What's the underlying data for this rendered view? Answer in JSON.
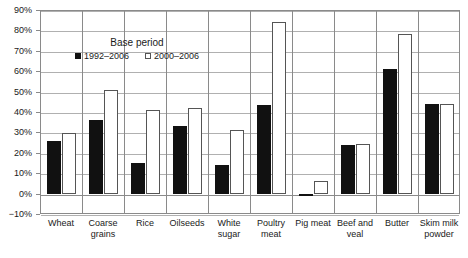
{
  "chart_data": {
    "type": "bar",
    "title": "",
    "xlabel": "",
    "ylabel": "",
    "ylim": [
      -10,
      90
    ],
    "ytick_step": 10,
    "ytick_labels": [
      "90%",
      "80%",
      "70%",
      "60%",
      "50%",
      "40%",
      "30%",
      "20%",
      "10%",
      "0%",
      "-10%"
    ],
    "ytick_values": [
      90,
      80,
      70,
      60,
      50,
      40,
      30,
      20,
      10,
      0,
      -10
    ],
    "grid": true,
    "legend_position": "inside-top-left",
    "legend_title": "Base period",
    "categories": [
      "Wheat",
      "Coarse grains",
      "Rice",
      "Oilseeds",
      "White sugar",
      "Poultry meat",
      "Pig meat",
      "Beef and veal",
      "Butter",
      "Skim milk powder"
    ],
    "series": [
      {
        "name": "1992-2006",
        "color": "#111111",
        "fill": "solid",
        "values": [
          26,
          36,
          15,
          33,
          14,
          43.5,
          -1,
          24,
          61,
          44
        ]
      },
      {
        "name": "2000-2006",
        "color": "#ffffff",
        "fill": "open",
        "values": [
          29.5,
          51,
          41,
          42,
          31,
          84,
          6,
          24.5,
          78,
          44
        ]
      }
    ]
  },
  "legend": {
    "title": "Base period",
    "entries": [
      {
        "label": "1992–2006",
        "swatch": "filled-square"
      },
      {
        "label": "2000–2006",
        "swatch": "open-square"
      }
    ]
  },
  "axes": {
    "y_labels": [
      "90%",
      "80%",
      "70%",
      "60%",
      "50%",
      "40%",
      "30%",
      "20%",
      "10%",
      "0%",
      "−10%"
    ],
    "x_labels": [
      [
        "Wheat"
      ],
      [
        "Coarse",
        "grains"
      ],
      [
        "Rice"
      ],
      [
        "Oilseeds"
      ],
      [
        "White",
        "sugar"
      ],
      [
        "Poultry",
        "meat"
      ],
      [
        "Pig meat"
      ],
      [
        "Beef and",
        "veal"
      ],
      [
        "Butter"
      ],
      [
        "Skim milk",
        "powder"
      ]
    ]
  }
}
